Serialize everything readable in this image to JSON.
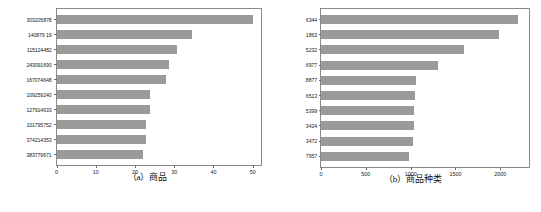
{
  "figure": {
    "background": "#ffffff",
    "bar_color": "#9a9a9a",
    "axis_color": "#8a8a8a"
  },
  "panels": [
    {
      "id": "panel-a",
      "caption": "（a）商品"
    },
    {
      "id": "panel-b",
      "caption": "（b）商品种类"
    }
  ],
  "chart_data": [
    {
      "type": "bar",
      "orientation": "horizontal",
      "title": "",
      "caption": "（a）商品",
      "xlabel": "",
      "ylabel": "",
      "xlim": [
        0,
        52
      ],
      "xticks": [
        0,
        10,
        20,
        30,
        40,
        50
      ],
      "xtick_labels": [
        "0",
        "10",
        "20",
        "30",
        "40",
        "50"
      ],
      "grid": false,
      "legend": "none",
      "categories": [
        "303205878",
        "140879 19",
        "115124482",
        "243091690",
        "167074648",
        "109259240",
        "127914633",
        "101795752",
        "374214353",
        "383779671"
      ],
      "values": [
        50,
        34.5,
        30.7,
        28.7,
        28.0,
        23.8,
        23.8,
        22.8,
        22.8,
        22.0
      ]
    },
    {
      "type": "bar",
      "orientation": "horizontal",
      "title": "",
      "caption": "（b）商品种类",
      "xlabel": "",
      "ylabel": "",
      "xlim": [
        0,
        2320
      ],
      "xticks": [
        0,
        500,
        1000,
        1500,
        2000
      ],
      "xtick_labels": [
        "0",
        "500",
        "1000",
        "1500",
        "2000"
      ],
      "grid": false,
      "legend": "none",
      "categories": [
        "6344",
        "1863",
        "5232",
        "6977",
        "8877",
        "6513",
        "5399",
        "3424",
        "3472",
        "7957"
      ],
      "values": [
        2200,
        1980,
        1600,
        1300,
        1060,
        1045,
        1040,
        1040,
        1030,
        985
      ]
    }
  ]
}
